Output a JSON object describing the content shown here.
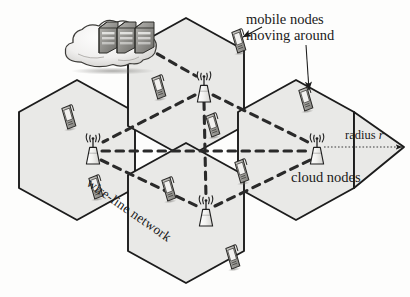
{
  "figure": {
    "background_color": "#fdfdfc",
    "cell_fill": "#e9e9e7",
    "cell_stroke": "#1c1c1c",
    "link_color": "#2a2a2a"
  },
  "labels": {
    "mobile_nodes_line1": "mobile nodes",
    "mobile_nodes_line2": "moving around",
    "cloud_nodes": "cloud nodes",
    "radius_prefix": "radius ",
    "radius_symbol": "r",
    "wire_line_network": "wire-line network"
  },
  "icons": {
    "cloud": "cloud-icon",
    "servers": "server-rack-icon",
    "tower": "cell-tower-icon",
    "phone": "mobile-phone-icon",
    "arrow": "arrow-icon"
  },
  "cells": [
    {
      "id": "cell-left",
      "cx": 77,
      "cy": 150,
      "label": "left cell"
    },
    {
      "id": "cell-top-middle",
      "cx": 186,
      "cy": 88,
      "label": "top middle cell"
    },
    {
      "id": "cell-right",
      "cx": 296,
      "cy": 150,
      "label": "right cell"
    },
    {
      "id": "cell-bottom",
      "cx": 186,
      "cy": 213,
      "label": "bottom cell"
    }
  ],
  "towers": [
    {
      "id": "tower-left",
      "x": 93,
      "y": 150,
      "cell": "cell-left"
    },
    {
      "id": "tower-top-middle",
      "x": 204,
      "y": 88,
      "cell": "cell-top-middle"
    },
    {
      "id": "tower-right",
      "x": 317,
      "y": 150,
      "cell": "cell-right"
    },
    {
      "id": "tower-bottom",
      "x": 206,
      "y": 212,
      "cell": "cell-bottom"
    }
  ],
  "phones": [
    {
      "id": "phone-1",
      "x": 68,
      "y": 118
    },
    {
      "id": "phone-2",
      "x": 95,
      "y": 188
    },
    {
      "id": "phone-3",
      "x": 158,
      "y": 88
    },
    {
      "id": "phone-4",
      "x": 212,
      "y": 126
    },
    {
      "id": "phone-5",
      "x": 168,
      "y": 190
    },
    {
      "id": "phone-6",
      "x": 241,
      "y": 172
    },
    {
      "id": "phone-7",
      "x": 238,
      "y": 42
    },
    {
      "id": "phone-8",
      "x": 305,
      "y": 100
    },
    {
      "id": "phone-9",
      "x": 232,
      "y": 258
    }
  ],
  "links": [
    {
      "from": "cloud",
      "to": "tower-top-middle"
    },
    {
      "from": "tower-top-middle",
      "to": "tower-left"
    },
    {
      "from": "tower-top-middle",
      "to": "tower-right"
    },
    {
      "from": "tower-top-middle",
      "to": "tower-bottom"
    },
    {
      "from": "tower-left",
      "to": "tower-bottom"
    },
    {
      "from": "tower-bottom",
      "to": "tower-right"
    },
    {
      "from": "tower-left",
      "to": "tower-right"
    }
  ],
  "radius_indicator": {
    "from_x": 322,
    "from_y": 147,
    "to_x": 404,
    "to_y": 147
  },
  "annotation_arrows": [
    {
      "id": "arrow-to-phone-7",
      "from_x": 253,
      "from_y": 30,
      "to_x": 244,
      "to_y": 38
    },
    {
      "id": "arrow-to-phone-8",
      "from_x": 308,
      "from_y": 42,
      "to_x": 310,
      "to_y": 92
    }
  ]
}
